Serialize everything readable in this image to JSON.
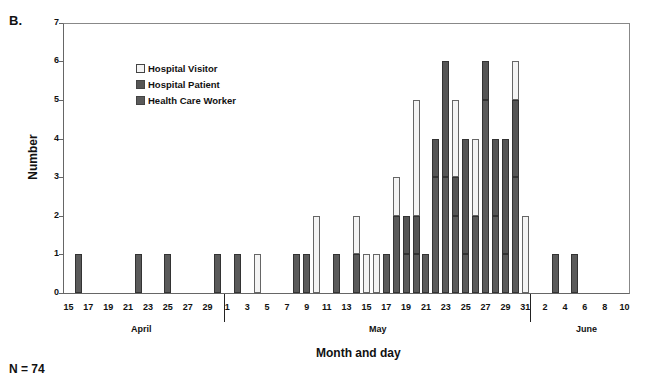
{
  "panel_label": "B.",
  "n_label": "N = 74",
  "colors": {
    "visitor": "#f4f4f4",
    "patient": "#555555",
    "hcw": "#5a5a5a"
  },
  "chart_data": {
    "type": "bar",
    "stacked": true,
    "title": "",
    "xlabel": "Month and day",
    "ylabel": "Number",
    "ylim": [
      0,
      7
    ],
    "yticks": [
      0,
      1,
      2,
      3,
      4,
      5,
      6,
      7
    ],
    "legend": [
      "Hospital Visitor",
      "Hospital Patient",
      "Health Care Worker"
    ],
    "legend_position": "upper-left inside plot",
    "grid": false,
    "x_tick_labels": [
      "15",
      "17",
      "19",
      "21",
      "23",
      "25",
      "27",
      "29",
      "1",
      "3",
      "5",
      "7",
      "9",
      "11",
      "13",
      "15",
      "17",
      "19",
      "21",
      "23",
      "25",
      "27",
      "29",
      "31",
      "2",
      "4",
      "6",
      "8",
      "10"
    ],
    "months": [
      "April",
      "May",
      "June"
    ],
    "n_total": 74,
    "bars": [
      {
        "date": "Apr 16",
        "hcw": 1,
        "patient": 0,
        "visitor": 0
      },
      {
        "date": "Apr 22",
        "hcw": 1,
        "patient": 0,
        "visitor": 0
      },
      {
        "date": "Apr 25",
        "hcw": 1,
        "patient": 0,
        "visitor": 0
      },
      {
        "date": "Apr 30",
        "hcw": 1,
        "patient": 0,
        "visitor": 0
      },
      {
        "date": "May 1",
        "hcw": 1,
        "patient": 0,
        "visitor": 0
      },
      {
        "date": "May 3",
        "hcw": 0,
        "patient": 0,
        "visitor": 1
      },
      {
        "date": "May 7",
        "hcw": 1,
        "patient": 0,
        "visitor": 0
      },
      {
        "date": "May 8",
        "hcw": 1,
        "patient": 0,
        "visitor": 0
      },
      {
        "date": "May 9",
        "hcw": 0,
        "patient": 0,
        "visitor": 2
      },
      {
        "date": "May 11",
        "hcw": 1,
        "patient": 0,
        "visitor": 0
      },
      {
        "date": "May 13",
        "hcw": 1,
        "patient": 0,
        "visitor": 1
      },
      {
        "date": "May 14",
        "hcw": 0,
        "patient": 0,
        "visitor": 1
      },
      {
        "date": "May 15",
        "hcw": 0,
        "patient": 0,
        "visitor": 1
      },
      {
        "date": "May 16",
        "hcw": 1,
        "patient": 0,
        "visitor": 0
      },
      {
        "date": "May 17",
        "hcw": 2,
        "patient": 0,
        "visitor": 1
      },
      {
        "date": "May 18",
        "hcw": 1,
        "patient": 1,
        "visitor": 0
      },
      {
        "date": "May 19",
        "hcw": 1,
        "patient": 1,
        "visitor": 3
      },
      {
        "date": "May 20",
        "hcw": 1,
        "patient": 0,
        "visitor": 0
      },
      {
        "date": "May 21",
        "hcw": 3,
        "patient": 1,
        "visitor": 0
      },
      {
        "date": "May 22",
        "hcw": 3,
        "patient": 3,
        "visitor": 0
      },
      {
        "date": "May 23",
        "hcw": 2,
        "patient": 1,
        "visitor": 2
      },
      {
        "date": "May 24",
        "hcw": 1,
        "patient": 3,
        "visitor": 0
      },
      {
        "date": "May 25",
        "hcw": 2,
        "patient": 0,
        "visitor": 2
      },
      {
        "date": "May 26",
        "hcw": 5,
        "patient": 1,
        "visitor": 0
      },
      {
        "date": "May 27",
        "hcw": 2,
        "patient": 2,
        "visitor": 0
      },
      {
        "date": "May 28",
        "hcw": 1,
        "patient": 3,
        "visitor": 0
      },
      {
        "date": "May 29",
        "hcw": 3,
        "patient": 2,
        "visitor": 1
      },
      {
        "date": "May 30",
        "hcw": 0,
        "patient": 0,
        "visitor": 2
      },
      {
        "date": "Jun 2",
        "hcw": 1,
        "patient": 0,
        "visitor": 0
      },
      {
        "date": "Jun 4",
        "hcw": 1,
        "patient": 0,
        "visitor": 0
      }
    ]
  }
}
